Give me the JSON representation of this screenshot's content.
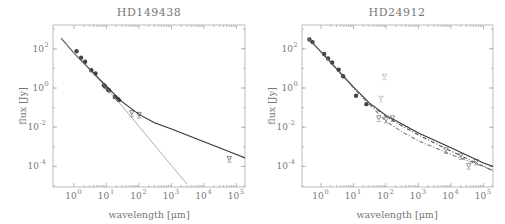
{
  "chart_data": [
    {
      "type": "scatter",
      "title": "HD149438",
      "xlabel": "wavelength [μm]",
      "ylabel": "flux [Jy]",
      "xscale": "log",
      "yscale": "log",
      "xlim": [
        0.25,
        200000
      ],
      "ylim": [
        1e-05,
        1500
      ],
      "x_ticks": [
        "10^0",
        "10^1",
        "10^2",
        "10^3",
        "10^4",
        "10^5"
      ],
      "y_ticks": [
        "10^2",
        "10^0",
        "10^-2",
        "10^-4"
      ],
      "grid": false,
      "series": [
        {
          "name": "observed photometry",
          "style": "filled-circle",
          "color": "#444444",
          "x": [
            1.2,
            1.65,
            2.2,
            3.4,
            4.6,
            8.3,
            9.0,
            11.0,
            12.0,
            18.0,
            22.0,
            24.0
          ],
          "y": [
            75,
            35,
            22,
            8.0,
            5.5,
            1.4,
            1.2,
            0.85,
            0.75,
            0.35,
            0.28,
            0.24
          ]
        },
        {
          "name": "upper limits / far-IR",
          "style": "open-triangle",
          "color": "#777777",
          "x": [
            60,
            100,
            60000
          ],
          "y": [
            0.055,
            0.045,
            0.00025
          ]
        },
        {
          "name": "photosphere + free-free model",
          "style": "solid-line",
          "color": "#333333",
          "x": [
            0.4,
            1,
            10,
            30,
            100,
            300,
            1000,
            10000,
            100000,
            200000
          ],
          "y": [
            350,
            60,
            1.2,
            0.2,
            0.045,
            0.017,
            0.008,
            0.0018,
            0.0004,
            0.00026
          ]
        },
        {
          "name": "photosphere (Rayleigh-Jeans)",
          "style": "thin-gray-line",
          "color": "#999999",
          "x": [
            0.4,
            1,
            10,
            30,
            100,
            1000,
            3000
          ],
          "y": [
            350,
            60,
            1.0,
            0.12,
            0.011,
            0.00011,
            1.25e-05
          ]
        }
      ]
    },
    {
      "type": "scatter",
      "title": "HD24912",
      "xlabel": "wavelength [μm]",
      "ylabel": "flux [Jy]",
      "xscale": "log",
      "yscale": "log",
      "xlim": [
        0.25,
        200000
      ],
      "ylim": [
        1e-05,
        1500
      ],
      "x_ticks": [
        "10^0",
        "10^1",
        "10^2",
        "10^3",
        "10^4",
        "10^5"
      ],
      "y_ticks": [
        "10^2",
        "10^0",
        "10^-2",
        "10^-4"
      ],
      "grid": false,
      "series": [
        {
          "name": "observed photometry",
          "style": "filled-circle",
          "color": "#444444",
          "x": [
            0.44,
            0.55,
            1.25,
            1.65,
            2.2,
            3.5,
            4.8,
            12,
            25
          ],
          "y": [
            300,
            220,
            55,
            32,
            20,
            8.5,
            4.0,
            0.4,
            0.15
          ]
        },
        {
          "name": "upper limits / far-IR",
          "style": "open-triangle",
          "color": "#888888",
          "x": [
            60,
            100,
            160,
            7000,
            20000,
            35000,
            60000
          ],
          "y": [
            0.03,
            0.025,
            0.03,
            0.0007,
            0.00035,
            0.00011,
            0.00018
          ]
        },
        {
          "name": "gray points (excess)",
          "style": "open-triangle",
          "color": "#bbbbbb",
          "x": [
            70,
            90
          ],
          "y": [
            0.3,
            4.0
          ]
        },
        {
          "name": "model total",
          "style": "solid-line",
          "color": "#333333",
          "x": [
            0.4,
            1,
            10,
            30,
            100,
            300,
            1000,
            10000,
            100000,
            200000
          ],
          "y": [
            350,
            70,
            1.1,
            0.18,
            0.04,
            0.015,
            0.005,
            0.0009,
            0.00015,
            0.0001
          ]
        },
        {
          "name": "model alt",
          "style": "dash-dot-line",
          "color": "#555555",
          "x": [
            0.4,
            1,
            10,
            30,
            100,
            300,
            1000,
            10000,
            100000,
            200000
          ],
          "y": [
            350,
            70,
            1.1,
            0.17,
            0.035,
            0.012,
            0.004,
            0.0006,
            0.0001,
            6e-05
          ]
        },
        {
          "name": "model photosphere",
          "style": "dash-dot-line",
          "color": "#777777",
          "x": [
            0.4,
            1,
            10,
            30,
            100,
            300,
            1000,
            10000,
            100000,
            200000
          ],
          "y": [
            350,
            70,
            1.0,
            0.15,
            0.02,
            0.006,
            0.002,
            0.0004,
            0.0001,
            6e-05
          ]
        }
      ]
    }
  ],
  "panels": [
    {
      "title": "HD149438",
      "xlabel": "wavelength [μm]",
      "ylabel": "flux [Jy]"
    },
    {
      "title": "HD24912",
      "xlabel": "wavelength [μm]",
      "ylabel": "flux [Jy]"
    }
  ]
}
